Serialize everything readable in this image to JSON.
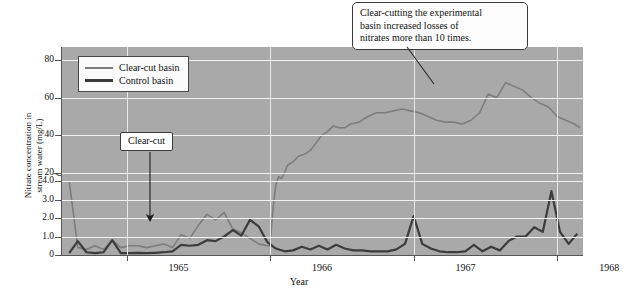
{
  "chart_data": {
    "type": "line",
    "title": "",
    "xlabel": "Year",
    "ylabel": "Nitrate concentration in stream water (mg/L)",
    "ylabel_line1": "Nitrate concentration in",
    "ylabel_line2": "stream water (mg/L)",
    "xlim": [
      1964.55,
      1968.18
    ],
    "xticks": [
      1965,
      1966,
      1967,
      1968
    ],
    "xticklabels": [
      "1965",
      "1966",
      "1967",
      "1968"
    ],
    "yticks": [
      0,
      1.0,
      2.0,
      3.0,
      4.0,
      20,
      40,
      60,
      80
    ],
    "yticklabels": [
      "0",
      "1.0",
      "2.0",
      "3.0",
      "4.0",
      "20",
      "40",
      "60",
      "80"
    ],
    "y_axis_break": true,
    "y_axis_break_between": [
      4.0,
      20
    ],
    "grid": "horizontal",
    "legend_position": "upper left",
    "plot_background": "#a9a9a9",
    "gridline_color": "#f2f2f2",
    "series": [
      {
        "name": "Clear-cut basin",
        "color": "#7d7d7d",
        "width": 1.6,
        "x": [
          1964.6,
          1964.66,
          1964.72,
          1964.78,
          1964.84,
          1964.9,
          1964.96,
          1965.02,
          1965.08,
          1965.14,
          1965.2,
          1965.26,
          1965.32,
          1965.38,
          1965.44,
          1965.5,
          1965.56,
          1965.62,
          1965.68,
          1965.74,
          1965.8,
          1965.86,
          1965.92,
          1965.98,
          1966.0,
          1966.02,
          1966.04,
          1966.06,
          1966.08,
          1966.1,
          1966.12,
          1966.16,
          1966.2,
          1966.24,
          1966.28,
          1966.32,
          1966.36,
          1966.4,
          1966.44,
          1966.48,
          1966.52,
          1966.56,
          1966.62,
          1966.68,
          1966.74,
          1966.8,
          1966.86,
          1966.92,
          1966.98,
          1967.04,
          1967.1,
          1967.16,
          1967.22,
          1967.28,
          1967.34,
          1967.4,
          1967.46,
          1967.52,
          1967.58,
          1967.64,
          1967.7,
          1967.76,
          1967.82,
          1967.88,
          1967.94,
          1968.0,
          1968.06,
          1968.12,
          1968.16
        ],
        "y": [
          4.0,
          0.4,
          0.3,
          0.5,
          0.3,
          0.8,
          0.4,
          0.5,
          0.5,
          0.4,
          0.5,
          0.6,
          0.4,
          1.1,
          0.9,
          1.6,
          2.2,
          1.9,
          2.3,
          1.4,
          1.2,
          0.9,
          0.6,
          0.5,
          0.5,
          2.5,
          14,
          18,
          17,
          20,
          24,
          26,
          29,
          30,
          32,
          36,
          40,
          42,
          45,
          44,
          44,
          46,
          47,
          50,
          52,
          52,
          53,
          54,
          53,
          52,
          50,
          48,
          47,
          47,
          46,
          48,
          52,
          62,
          60,
          68,
          66,
          64,
          60,
          57,
          55,
          50,
          48,
          46,
          44
        ],
        "y_note": "Values before 1966.0 are on the lower (0-4 mg/L) expanded scale; the pre-cut clear-cut basin tracked the control basin closely."
      },
      {
        "name": "Control basin",
        "color": "#3c3c3c",
        "width": 2.2,
        "x": [
          1964.6,
          1964.66,
          1964.72,
          1964.78,
          1964.84,
          1964.9,
          1964.96,
          1965.02,
          1965.08,
          1965.14,
          1965.2,
          1965.26,
          1965.32,
          1965.38,
          1965.44,
          1965.5,
          1965.56,
          1965.62,
          1965.68,
          1965.74,
          1965.8,
          1965.86,
          1965.92,
          1965.98,
          1966.04,
          1966.1,
          1966.16,
          1966.22,
          1966.28,
          1966.34,
          1966.4,
          1966.46,
          1966.52,
          1966.58,
          1966.64,
          1966.7,
          1966.76,
          1966.82,
          1966.88,
          1966.94,
          1967.0,
          1967.06,
          1967.12,
          1967.18,
          1967.24,
          1967.3,
          1967.36,
          1967.42,
          1967.48,
          1967.54,
          1967.6,
          1967.66,
          1967.72,
          1967.78,
          1967.84,
          1967.9,
          1967.96,
          1968.02,
          1968.08,
          1968.14
        ],
        "y": [
          0.1,
          0.75,
          0.15,
          0.1,
          0.15,
          0.8,
          0.1,
          0.1,
          0.12,
          0.1,
          0.12,
          0.15,
          0.2,
          0.55,
          0.5,
          0.55,
          0.8,
          0.75,
          1.0,
          1.35,
          1.05,
          1.9,
          1.55,
          0.7,
          0.35,
          0.2,
          0.25,
          0.45,
          0.3,
          0.5,
          0.3,
          0.55,
          0.35,
          0.25,
          0.25,
          0.2,
          0.2,
          0.2,
          0.3,
          0.6,
          2.1,
          0.6,
          0.35,
          0.2,
          0.15,
          0.15,
          0.2,
          0.55,
          0.2,
          0.45,
          0.25,
          0.75,
          1.0,
          1.0,
          1.5,
          1.25,
          3.45,
          1.25,
          0.6,
          1.15
        ]
      }
    ],
    "annotations": [
      {
        "name": "main-callout",
        "text": "Clear-cutting the experimental basin increased losses of nitrates more than 10 times.",
        "lines": [
          "Clear-cutting the experimental",
          "basin increased losses of",
          "nitrates more than 10 times."
        ],
        "leader_line": true
      },
      {
        "name": "clear-cut-marker",
        "text": "Clear-cut",
        "arrow": "down",
        "points_to_year": 1965.4
      }
    ]
  },
  "legend": {
    "items": [
      {
        "label": "Clear-cut basin",
        "swatch": "clearcut-line-swatch"
      },
      {
        "label": "Control basin",
        "swatch": "control-line-swatch"
      }
    ]
  }
}
